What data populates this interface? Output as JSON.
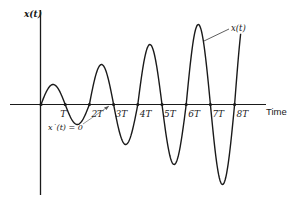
{
  "figure": {
    "y_axis_label": "x(t)",
    "x_axis_label": "Time",
    "curve_label": "x(t)",
    "annotation": "x˙(t) = 0",
    "tick_labels": [
      "T",
      "2T",
      "3T",
      "4T",
      "5T",
      "6T",
      "7T",
      "8T"
    ],
    "stroke_color": "#1a1a1a",
    "background": "#ffffff"
  },
  "chart_data": {
    "type": "line",
    "title": "",
    "xlabel": "Time",
    "ylabel": "x(t)",
    "x_ticks": [
      "0",
      "T",
      "2T",
      "3T",
      "4T",
      "5T",
      "6T",
      "7T",
      "8T"
    ],
    "zero_crossings": [
      0,
      1,
      2,
      3,
      4,
      5,
      6,
      7,
      8
    ],
    "extrema": [
      {
        "t": 0.5,
        "x": 1,
        "type": "max"
      },
      {
        "t": 1.5,
        "x": -1,
        "type": "min"
      },
      {
        "t": 2.5,
        "x": 2,
        "type": "max"
      },
      {
        "t": 3.5,
        "x": -2,
        "type": "min"
      },
      {
        "t": 4.5,
        "x": 3,
        "type": "max"
      },
      {
        "t": 5.5,
        "x": -3,
        "type": "min"
      },
      {
        "t": 6.5,
        "x": 4,
        "type": "max"
      },
      {
        "t": 7.5,
        "x": -4,
        "type": "min"
      }
    ],
    "curve_end": {
      "t": 8.25,
      "x": 2.6
    },
    "annotations": [
      {
        "text": "x(t)",
        "points_to": "curve near 6.5T peak descending side"
      },
      {
        "text": "x˙(t) = 0",
        "points_to": "zero crossing near 3T"
      }
    ],
    "grid": false,
    "legend": "none"
  }
}
